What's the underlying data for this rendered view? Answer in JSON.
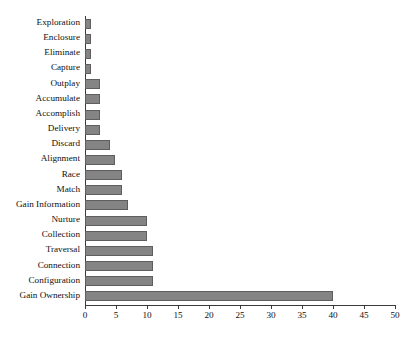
{
  "chart_data": {
    "type": "bar",
    "orientation": "horizontal",
    "title": "",
    "subtitle": "",
    "xlabel": "",
    "ylabel": "",
    "xlim": [
      0,
      50
    ],
    "ylim": null,
    "grid": false,
    "legend": null,
    "legend_position": "none",
    "xticks": [
      0,
      5,
      10,
      15,
      20,
      25,
      30,
      35,
      40,
      45,
      50
    ],
    "xtick_labels": [
      "0",
      "5",
      "10",
      "15",
      "20",
      "25",
      "30",
      "35",
      "40",
      "45",
      "50"
    ],
    "bar_color": "#848484",
    "bar_edge_color": "#5e5e5e",
    "axis_color": "#3a3a3a",
    "background": "#ffffff",
    "categories": [
      "Exploration",
      "Enclosure",
      "Eliminate",
      "Capture",
      "Outplay",
      "Accumulate",
      "Accomplish",
      "Delivery",
      "Discard",
      "Alignment",
      "Race",
      "Match",
      "Gain Information",
      "Nurture",
      "Collection",
      "Traversal",
      "Connection",
      "Configuration",
      "Gain Ownership"
    ],
    "values": [
      1,
      1,
      1,
      1,
      2.4,
      2.4,
      2.4,
      2.4,
      4,
      4.8,
      6,
      6,
      7,
      10,
      10,
      11,
      11,
      11,
      40
    ]
  }
}
